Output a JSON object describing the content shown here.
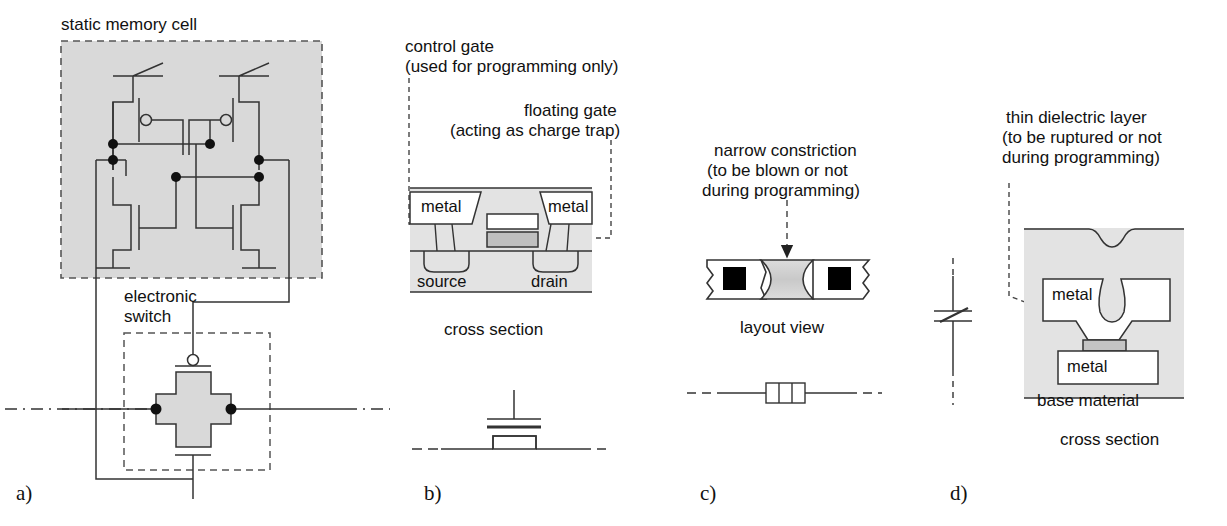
{
  "figure": {
    "panels": [
      {
        "letter": "a)",
        "topic": "static memory cell"
      },
      {
        "letter": "b)",
        "topic": "floating gate transistor"
      },
      {
        "letter": "c)",
        "topic": "fuse"
      },
      {
        "letter": "d)",
        "topic": "antifuse"
      }
    ]
  },
  "panel_a": {
    "letter": "a)",
    "title": "static memory cell",
    "switch_label_line1": "electronic",
    "switch_label_line2": "switch"
  },
  "panel_b": {
    "letter": "b)",
    "control_gate_line1": "control gate",
    "control_gate_line2": "(used for programming only)",
    "floating_gate_line1": "floating gate",
    "floating_gate_line2": "(acting as charge trap)",
    "metal_left": "metal",
    "metal_right": "metal",
    "source": "source",
    "drain": "drain",
    "caption": "cross section"
  },
  "panel_c": {
    "letter": "c)",
    "callout_line1": "narrow constriction",
    "callout_line2": "(to be blown or not",
    "callout_line3": "during programming)",
    "caption": "layout view"
  },
  "panel_d": {
    "letter": "d)",
    "callout_line1": "thin dielectric layer",
    "callout_line2": "(to be ruptured or not",
    "callout_line3": "during programming)",
    "metal_top": "metal",
    "metal_bottom": "metal",
    "base_material": "base material",
    "caption": "cross section"
  },
  "colors": {
    "line": "#333333",
    "fill_gray": "#d9d9d9",
    "fill_midgray": "#bfbfbf",
    "black": "#000000",
    "white": "#ffffff",
    "dash": "#555555"
  }
}
